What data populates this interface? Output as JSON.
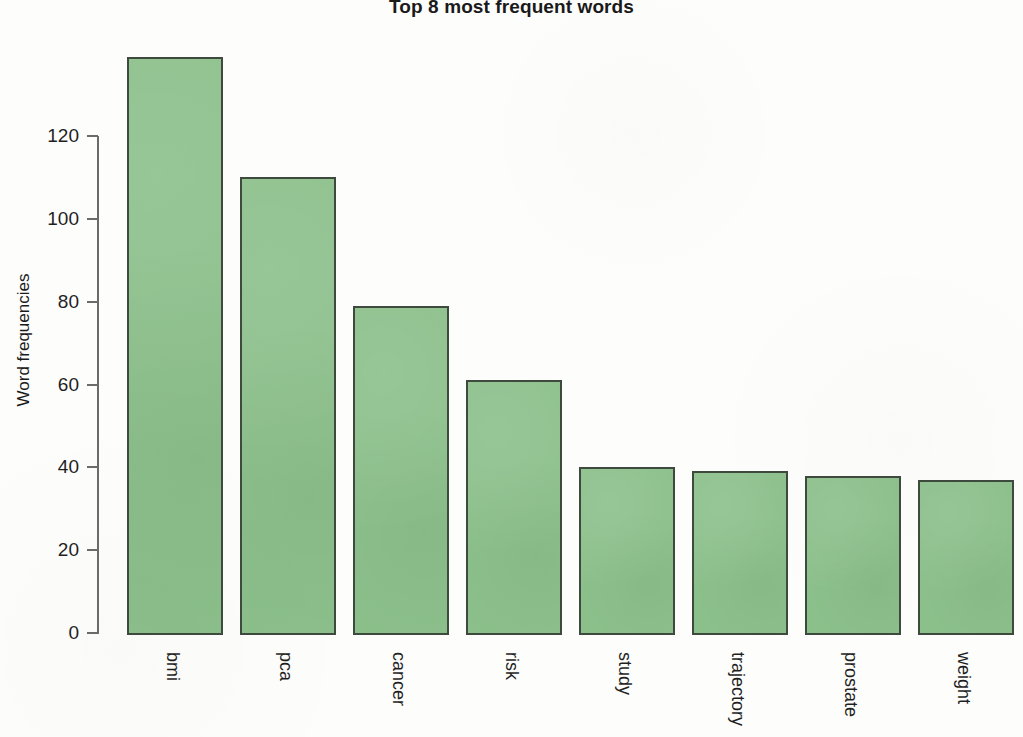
{
  "chart_data": {
    "type": "bar",
    "title": "Top 8 most frequent words",
    "xlabel": "",
    "ylabel": "Word frequencies",
    "categories": [
      "bmi",
      "pca",
      "cancer",
      "risk",
      "study",
      "trajectory",
      "prostate",
      "weight"
    ],
    "values": [
      139,
      110,
      79,
      61,
      40,
      39,
      38,
      37
    ],
    "ylim": [
      0,
      139
    ],
    "y_ticks": [
      0,
      20,
      40,
      60,
      80,
      100,
      120
    ],
    "grid": false,
    "legend": null,
    "bar_fill_color": "#8cc08b",
    "bar_edge_color": "#3f4a3f",
    "background_color": "#fdfdfc",
    "axis_color": "#6b6b6b",
    "text_color": "#1f1f1f",
    "x_tick_label_rotation": 90
  }
}
